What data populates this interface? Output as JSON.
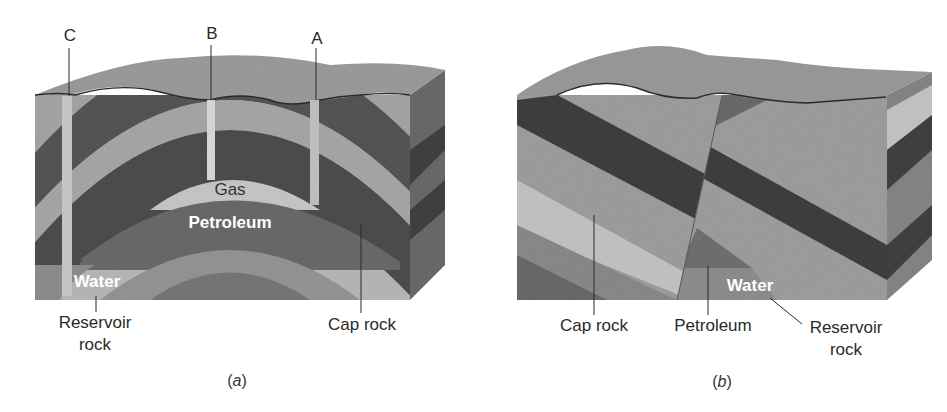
{
  "figure": {
    "panels": [
      {
        "id": "a",
        "caption_letter": "a",
        "wells": [
          "C",
          "B",
          "A"
        ],
        "inner_labels": {
          "gas": "Gas",
          "petroleum": "Petroleum",
          "water": "Water"
        },
        "callouts": {
          "reservoir_rock_line1": "Reservoir",
          "reservoir_rock_line2": "rock",
          "cap_rock": "Cap rock"
        }
      },
      {
        "id": "b",
        "caption_letter": "b",
        "inner_labels": {
          "water": "Water"
        },
        "callouts": {
          "cap_rock": "Cap rock",
          "petroleum": "Petroleum",
          "reservoir_rock_line1": "Reservoir",
          "reservoir_rock_line2": "rock"
        }
      }
    ],
    "colors": {
      "surface": "#9a9a9a",
      "light_layer": "#b4b4b4",
      "mid_layer": "#8c8c8c",
      "dark_layer": "#4a4a4a",
      "petroleum": "#6e6e6e",
      "gas": "#c6c6c6",
      "well": "#c8c8c8",
      "text": "#2a2a2a"
    }
  }
}
